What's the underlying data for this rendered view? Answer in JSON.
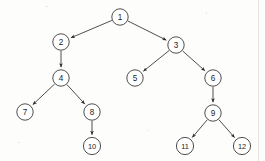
{
  "diagram": {
    "type": "rooted-directed-tree",
    "background_color": "#fdfdfc",
    "stroke_color": "#3b3b3b",
    "node_fill_color": "#ffffff",
    "node_radius": 8.2,
    "canvas": {
      "width": 265,
      "height": 161
    }
  },
  "nodes": [
    {
      "id": "1",
      "label": "1",
      "x": 120,
      "y": 17,
      "r": 8.2,
      "level": 0
    },
    {
      "id": "2",
      "label": "2",
      "x": 61,
      "y": 42,
      "r": 8.2,
      "level": 1
    },
    {
      "id": "3",
      "label": "3",
      "x": 176,
      "y": 45,
      "r": 8.2,
      "level": 1
    },
    {
      "id": "4",
      "label": "4",
      "x": 61,
      "y": 78,
      "r": 8.2,
      "level": 2
    },
    {
      "id": "5",
      "label": "5",
      "x": 135,
      "y": 78,
      "r": 8.2,
      "level": 2
    },
    {
      "id": "6",
      "label": "6",
      "x": 213,
      "y": 78,
      "r": 8.2,
      "level": 2
    },
    {
      "id": "7",
      "label": "7",
      "x": 25,
      "y": 112,
      "r": 8.2,
      "level": 3
    },
    {
      "id": "8",
      "label": "8",
      "x": 92,
      "y": 112,
      "r": 8.2,
      "level": 3
    },
    {
      "id": "9",
      "label": "9",
      "x": 213,
      "y": 113,
      "r": 8.2,
      "level": 3
    },
    {
      "id": "10",
      "label": "10",
      "x": 92,
      "y": 146,
      "r": 8.6,
      "level": 4
    },
    {
      "id": "11",
      "label": "11",
      "x": 185,
      "y": 146,
      "r": 8.6,
      "level": 4
    },
    {
      "id": "12",
      "label": "12",
      "x": 242,
      "y": 146,
      "r": 8.6,
      "level": 4
    }
  ],
  "edges": [
    {
      "from": "1",
      "to": "2",
      "directed": true
    },
    {
      "from": "1",
      "to": "3",
      "directed": true
    },
    {
      "from": "2",
      "to": "4",
      "directed": true
    },
    {
      "from": "3",
      "to": "5",
      "directed": true
    },
    {
      "from": "3",
      "to": "6",
      "directed": true
    },
    {
      "from": "4",
      "to": "7",
      "directed": true
    },
    {
      "from": "4",
      "to": "8",
      "directed": true
    },
    {
      "from": "6",
      "to": "9",
      "directed": true
    },
    {
      "from": "8",
      "to": "10",
      "directed": true
    },
    {
      "from": "9",
      "to": "11",
      "directed": true
    },
    {
      "from": "9",
      "to": "12",
      "directed": true
    }
  ]
}
